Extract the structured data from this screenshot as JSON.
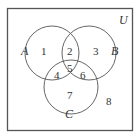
{
  "diagram": {
    "type": "venn",
    "universe_label": "U",
    "sets": [
      {
        "label": "A"
      },
      {
        "label": "B"
      },
      {
        "label": "C"
      }
    ],
    "regions": [
      "1",
      "2",
      "3",
      "4",
      "5",
      "6",
      "7",
      "8"
    ],
    "colors": {
      "stroke": "#555555",
      "text": "#333333",
      "background": "#ffffff"
    }
  }
}
